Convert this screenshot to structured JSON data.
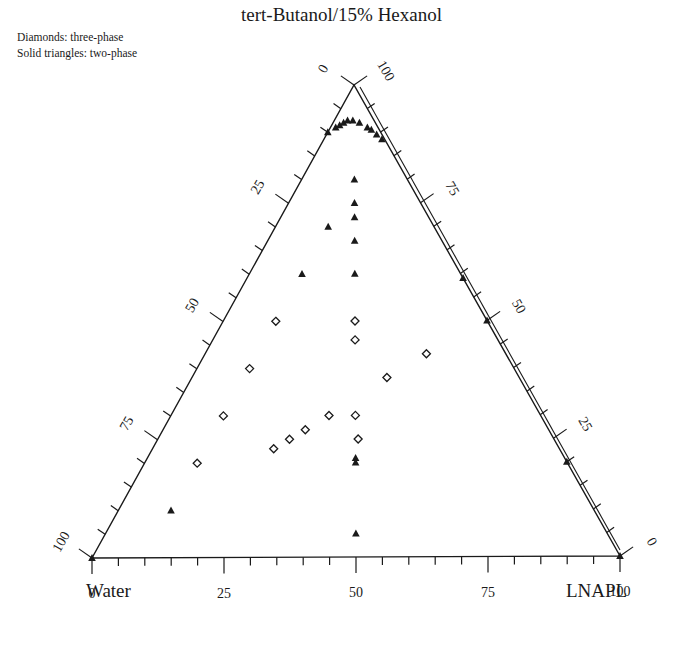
{
  "title": "tert-Butanol/15% Hexanol",
  "legend": {
    "diamonds": "Diamonds: three-phase",
    "triangles": "Solid triangles: two-phase"
  },
  "vertices": {
    "bottom_left": "Water",
    "bottom_right": "LNAPL",
    "top": "tert-Butanol/15% Hexanol"
  },
  "colors": {
    "ink": "#1a1a1a",
    "background": "#ffffff"
  },
  "chart_data": {
    "type": "ternary-scatter",
    "title": "tert-Butanol/15% Hexanol",
    "components": [
      "Water",
      "LNAPL",
      "tert-Butanol/15% Hexanol"
    ],
    "axes": {
      "bottom": {
        "label": "LNAPL",
        "ticks": [
          "0",
          "25",
          "50",
          "75",
          "100"
        ],
        "range": [
          0,
          100
        ]
      },
      "left": {
        "label": "Alcohol",
        "ticks": [
          "0",
          "25",
          "50",
          "75",
          "100"
        ],
        "range": [
          0,
          100
        ],
        "direction": "top-to-bottom"
      },
      "right": {
        "label": "Alcohol",
        "ticks": [
          "100",
          "75",
          "50",
          "25",
          "0"
        ],
        "range": [
          0,
          100
        ],
        "direction": "top-to-bottom"
      }
    },
    "legend": [
      "Diamonds: three-phase",
      "Solid triangles: two-phase"
    ],
    "series": [
      {
        "name": "three-phase",
        "marker": "diamond-open",
        "points": [
          {
            "water": 40,
            "lnapl": 10,
            "alcohol": 50
          },
          {
            "water": 25,
            "lnapl": 25,
            "alcohol": 50
          },
          {
            "water": 27,
            "lnapl": 27,
            "alcohol": 46
          },
          {
            "water": 50,
            "lnapl": 10,
            "alcohol": 40
          },
          {
            "water": 15,
            "lnapl": 42,
            "alcohol": 43
          },
          {
            "water": 25,
            "lnapl": 37,
            "alcohol": 38
          },
          {
            "water": 60,
            "lnapl": 10,
            "alcohol": 30
          },
          {
            "water": 40,
            "lnapl": 30,
            "alcohol": 30
          },
          {
            "water": 35,
            "lnapl": 35,
            "alcohol": 30
          },
          {
            "water": 46,
            "lnapl": 27,
            "alcohol": 27
          },
          {
            "water": 50,
            "lnapl": 25,
            "alcohol": 25
          },
          {
            "water": 37,
            "lnapl": 38,
            "alcohol": 25
          },
          {
            "water": 54,
            "lnapl": 23,
            "alcohol": 23
          },
          {
            "water": 70,
            "lnapl": 10,
            "alcohol": 20
          }
        ]
      },
      {
        "name": "two-phase",
        "marker": "triangle-solid",
        "points": [
          {
            "water": 10,
            "lnapl": 10,
            "alcohol": 80
          },
          {
            "water": 12.5,
            "lnapl": 12.5,
            "alcohol": 75
          },
          {
            "water": 14,
            "lnapl": 14,
            "alcohol": 72
          },
          {
            "water": 20,
            "lnapl": 10,
            "alcohol": 70
          },
          {
            "water": 16.5,
            "lnapl": 16.5,
            "alcohol": 67
          },
          {
            "water": 30,
            "lnapl": 10,
            "alcohol": 60
          },
          {
            "water": 20,
            "lnapl": 20,
            "alcohol": 60
          },
          {
            "water": 39.5,
            "lnapl": 39.5,
            "alcohol": 21
          },
          {
            "water": 40,
            "lnapl": 40,
            "alcohol": 20
          },
          {
            "water": 80,
            "lnapl": 10,
            "alcohol": 10
          },
          {
            "water": 47.5,
            "lnapl": 47.5,
            "alcohol": 5
          },
          {
            "water": 0,
            "lnapl": 41,
            "alcohol": 59
          },
          {
            "water": 0,
            "lnapl": 50,
            "alcohol": 50
          },
          {
            "water": 0,
            "lnapl": 80,
            "alcohol": 20
          },
          {
            "water": 100,
            "lnapl": 0,
            "alcohol": 0
          },
          {
            "water": 0,
            "lnapl": 100,
            "alcohol": 0
          }
        ]
      },
      {
        "name": "binodal-curve",
        "marker": "triangle-solid",
        "points": [
          {
            "water": 10,
            "lnapl": 0,
            "alcohol": 90
          },
          {
            "water": 8,
            "lnapl": 1,
            "alcohol": 91
          },
          {
            "water": 7,
            "lnapl": 1.5,
            "alcohol": 91.5
          },
          {
            "water": 6,
            "lnapl": 2,
            "alcohol": 92
          },
          {
            "water": 5,
            "lnapl": 2.5,
            "alcohol": 92.5
          },
          {
            "water": 4,
            "lnapl": 3.5,
            "alcohol": 92.5
          },
          {
            "water": 3,
            "lnapl": 5,
            "alcohol": 92
          },
          {
            "water": 2,
            "lnapl": 7,
            "alcohol": 91
          },
          {
            "water": 1.5,
            "lnapl": 8,
            "alcohol": 90.5
          },
          {
            "water": 1,
            "lnapl": 9.5,
            "alcohol": 89.5
          },
          {
            "water": 0.5,
            "lnapl": 11,
            "alcohol": 88.5
          }
        ]
      }
    ]
  }
}
